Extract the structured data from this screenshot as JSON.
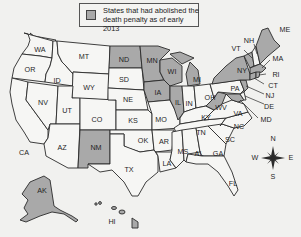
{
  "legend": {
    "text": "States that had abolished the death penalty as of early 2013",
    "swatch_color": "#a9a9a9"
  },
  "colors": {
    "abolished": "#a9a9a9",
    "not_abolished": "#f6f6f4",
    "border": "#2a2a2a",
    "background": "#f1f1ef"
  },
  "compass": {
    "n": "N",
    "s": "S",
    "e": "E",
    "w": "W"
  },
  "states": {
    "WA": {
      "label": "WA",
      "abolished": false
    },
    "OR": {
      "label": "OR",
      "abolished": false
    },
    "CA": {
      "label": "CA",
      "abolished": false
    },
    "ID": {
      "label": "ID",
      "abolished": false
    },
    "NV": {
      "label": "NV",
      "abolished": false
    },
    "MT": {
      "label": "MT",
      "abolished": false
    },
    "WY": {
      "label": "WY",
      "abolished": false
    },
    "UT": {
      "label": "UT",
      "abolished": false
    },
    "AZ": {
      "label": "AZ",
      "abolished": false
    },
    "CO": {
      "label": "CO",
      "abolished": false
    },
    "NM": {
      "label": "NM",
      "abolished": true
    },
    "ND": {
      "label": "ND",
      "abolished": true
    },
    "SD": {
      "label": "SD",
      "abolished": false
    },
    "NE": {
      "label": "NE",
      "abolished": false
    },
    "KS": {
      "label": "KS",
      "abolished": false
    },
    "OK": {
      "label": "OK",
      "abolished": false
    },
    "TX": {
      "label": "TX",
      "abolished": false
    },
    "MN": {
      "label": "MN",
      "abolished": true
    },
    "IA": {
      "label": "IA",
      "abolished": true
    },
    "MO": {
      "label": "MO",
      "abolished": false
    },
    "AR": {
      "label": "AR",
      "abolished": false
    },
    "LA": {
      "label": "LA",
      "abolished": false
    },
    "WI": {
      "label": "WI",
      "abolished": true
    },
    "IL": {
      "label": "IL",
      "abolished": true
    },
    "MI": {
      "label": "MI",
      "abolished": true
    },
    "IN": {
      "label": "IN",
      "abolished": false
    },
    "OH": {
      "label": "OH",
      "abolished": false
    },
    "KY": {
      "label": "KY",
      "abolished": false
    },
    "TN": {
      "label": "TN",
      "abolished": false
    },
    "MS": {
      "label": "MS",
      "abolished": false
    },
    "AL": {
      "label": "AL",
      "abolished": false
    },
    "GA": {
      "label": "GA",
      "abolished": false
    },
    "FL": {
      "label": "FL",
      "abolished": false
    },
    "SC": {
      "label": "SC",
      "abolished": false
    },
    "NC": {
      "label": "NC",
      "abolished": false
    },
    "VA": {
      "label": "VA",
      "abolished": false
    },
    "WV": {
      "label": "WV",
      "abolished": true
    },
    "MD": {
      "label": "MD",
      "abolished": true
    },
    "DE": {
      "label": "DE",
      "abolished": false
    },
    "PA": {
      "label": "PA",
      "abolished": false
    },
    "NJ": {
      "label": "NJ",
      "abolished": true
    },
    "NY": {
      "label": "NY",
      "abolished": true
    },
    "CT": {
      "label": "CT",
      "abolished": true
    },
    "RI": {
      "label": "RI",
      "abolished": true
    },
    "MA": {
      "label": "MA",
      "abolished": true
    },
    "VT": {
      "label": "VT",
      "abolished": true
    },
    "NH": {
      "label": "NH",
      "abolished": false
    },
    "ME": {
      "label": "ME",
      "abolished": true
    },
    "AK": {
      "label": "AK",
      "abolished": true
    },
    "HI": {
      "label": "HI",
      "abolished": true
    }
  }
}
